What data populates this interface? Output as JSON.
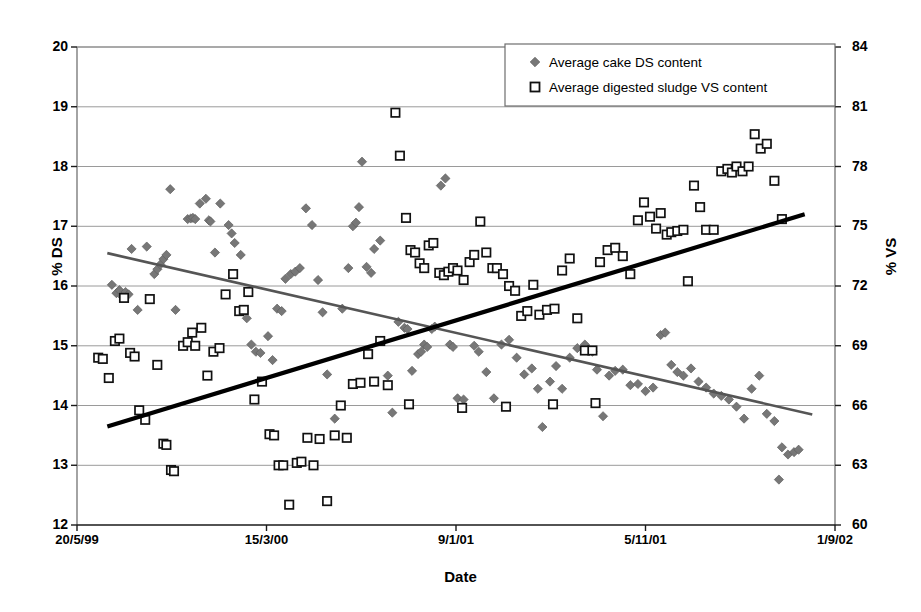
{
  "chart_data": {
    "type": "scatter",
    "title": "",
    "xlabel": "Date",
    "ylabel": "% DS",
    "y2label": "% VS",
    "xlim": [
      0,
      100
    ],
    "ylim": [
      12,
      20
    ],
    "y2lim": [
      60,
      84
    ],
    "grid": true,
    "legend_position": "top-right",
    "x_tick_labels": [
      "20/5/99",
      "15/3/00",
      "9/1/01",
      "5/11/01",
      "1/9/02"
    ],
    "x_tick_positions": [
      0,
      25,
      50,
      75,
      100
    ],
    "y_tick_labels": [
      "12",
      "13",
      "14",
      "15",
      "16",
      "17",
      "18",
      "19",
      "20"
    ],
    "y2_tick_labels": [
      "60",
      "63",
      "66",
      "69",
      "72",
      "75",
      "78",
      "81",
      "84"
    ],
    "series": [
      {
        "name": "Average cake DS content",
        "marker": "filled-diamond",
        "color": "#777777",
        "axis": "left",
        "points": [
          [
            4.6,
            16.02
          ],
          [
            5.2,
            15.88
          ],
          [
            5.6,
            15.93
          ],
          [
            6.0,
            15.82
          ],
          [
            6.4,
            15.9
          ],
          [
            6.8,
            15.86
          ],
          [
            7.2,
            16.62
          ],
          [
            8.0,
            15.6
          ],
          [
            9.2,
            16.66
          ],
          [
            10.2,
            16.2
          ],
          [
            10.6,
            16.28
          ],
          [
            11.0,
            16.36
          ],
          [
            11.4,
            16.45
          ],
          [
            11.8,
            16.52
          ],
          [
            12.3,
            17.62
          ],
          [
            13.0,
            15.6
          ],
          [
            14.6,
            17.12
          ],
          [
            15.0,
            17.13
          ],
          [
            15.3,
            17.14
          ],
          [
            15.6,
            17.12
          ],
          [
            16.2,
            17.38
          ],
          [
            17.0,
            17.46
          ],
          [
            17.4,
            17.1
          ],
          [
            17.6,
            17.08
          ],
          [
            18.2,
            16.56
          ],
          [
            18.9,
            17.38
          ],
          [
            20.0,
            17.02
          ],
          [
            20.4,
            16.88
          ],
          [
            20.8,
            16.72
          ],
          [
            21.6,
            16.52
          ],
          [
            22.4,
            15.46
          ],
          [
            23.0,
            15.02
          ],
          [
            23.6,
            14.9
          ],
          [
            24.2,
            14.88
          ],
          [
            25.2,
            15.16
          ],
          [
            25.8,
            14.76
          ],
          [
            26.4,
            15.62
          ],
          [
            27.0,
            15.58
          ],
          [
            27.5,
            16.12
          ],
          [
            28.2,
            16.2
          ],
          [
            28.8,
            16.24
          ],
          [
            29.4,
            16.3
          ],
          [
            30.2,
            17.3
          ],
          [
            31.0,
            17.02
          ],
          [
            31.8,
            16.1
          ],
          [
            32.4,
            15.56
          ],
          [
            33.0,
            14.52
          ],
          [
            34.0,
            13.78
          ],
          [
            35.0,
            15.62
          ],
          [
            35.8,
            16.3
          ],
          [
            36.4,
            17.0
          ],
          [
            36.8,
            17.06
          ],
          [
            37.2,
            17.32
          ],
          [
            37.6,
            18.08
          ],
          [
            38.2,
            16.32
          ],
          [
            38.8,
            16.22
          ],
          [
            39.2,
            16.62
          ],
          [
            40.0,
            16.76
          ],
          [
            41.0,
            14.5
          ],
          [
            41.6,
            13.88
          ],
          [
            42.4,
            15.4
          ],
          [
            43.2,
            15.3
          ],
          [
            43.6,
            15.28
          ],
          [
            44.2,
            14.58
          ],
          [
            45.0,
            14.86
          ],
          [
            45.4,
            14.9
          ],
          [
            45.8,
            15.02
          ],
          [
            46.2,
            14.98
          ],
          [
            46.8,
            15.28
          ],
          [
            47.2,
            15.32
          ],
          [
            48.0,
            17.68
          ],
          [
            48.6,
            17.8
          ],
          [
            49.2,
            15.02
          ],
          [
            49.6,
            14.98
          ],
          [
            50.2,
            14.12
          ],
          [
            51.0,
            14.1
          ],
          [
            52.4,
            15.0
          ],
          [
            53.0,
            14.9
          ],
          [
            54.0,
            14.56
          ],
          [
            55.0,
            14.12
          ],
          [
            56.0,
            15.02
          ],
          [
            57.0,
            15.1
          ],
          [
            58.0,
            14.8
          ],
          [
            59.0,
            14.52
          ],
          [
            60.0,
            14.62
          ],
          [
            60.8,
            14.28
          ],
          [
            61.4,
            13.64
          ],
          [
            62.4,
            14.4
          ],
          [
            63.2,
            14.66
          ],
          [
            64.0,
            14.28
          ],
          [
            65.0,
            14.8
          ],
          [
            66.0,
            14.96
          ],
          [
            67.0,
            15.02
          ],
          [
            68.0,
            14.9
          ],
          [
            68.6,
            14.6
          ],
          [
            69.4,
            13.82
          ],
          [
            70.2,
            14.5
          ],
          [
            71.0,
            14.58
          ],
          [
            72.0,
            14.6
          ],
          [
            73.0,
            14.34
          ],
          [
            74.0,
            14.36
          ],
          [
            75.0,
            14.24
          ],
          [
            76.0,
            14.3
          ],
          [
            77.0,
            15.18
          ],
          [
            77.6,
            15.22
          ],
          [
            78.4,
            14.68
          ],
          [
            79.2,
            14.56
          ],
          [
            80.0,
            14.5
          ],
          [
            81.0,
            14.62
          ],
          [
            82.0,
            14.4
          ],
          [
            83.0,
            14.3
          ],
          [
            84.0,
            14.2
          ],
          [
            85.0,
            14.16
          ],
          [
            86.0,
            14.1
          ],
          [
            87.0,
            13.98
          ],
          [
            88.0,
            13.78
          ],
          [
            89.0,
            14.28
          ],
          [
            90.0,
            14.5
          ],
          [
            91.0,
            13.86
          ],
          [
            92.0,
            13.74
          ],
          [
            93.0,
            13.3
          ],
          [
            93.8,
            13.18
          ],
          [
            94.6,
            13.22
          ],
          [
            95.2,
            13.26
          ],
          [
            92.6,
            12.76
          ]
        ]
      },
      {
        "name": "Average digested sludge VS content",
        "marker": "open-square",
        "color": "#ffffff",
        "edge_color": "#000000",
        "axis": "right",
        "points_ds_equiv": [
          [
            2.8,
            14.8
          ],
          [
            3.4,
            14.78
          ],
          [
            4.2,
            14.46
          ],
          [
            5.0,
            15.08
          ],
          [
            5.6,
            15.12
          ],
          [
            6.2,
            15.8
          ],
          [
            7.0,
            14.88
          ],
          [
            7.6,
            14.82
          ],
          [
            8.2,
            13.92
          ],
          [
            9.0,
            13.76
          ],
          [
            9.6,
            15.78
          ],
          [
            10.6,
            14.68
          ],
          [
            11.4,
            13.36
          ],
          [
            11.8,
            13.34
          ],
          [
            12.4,
            12.92
          ],
          [
            12.8,
            12.9
          ],
          [
            14.0,
            15.0
          ],
          [
            14.6,
            15.06
          ],
          [
            15.2,
            15.22
          ],
          [
            15.6,
            15.0
          ],
          [
            16.4,
            15.3
          ],
          [
            17.2,
            14.5
          ],
          [
            18.0,
            14.9
          ],
          [
            18.8,
            14.96
          ],
          [
            19.6,
            15.86
          ],
          [
            20.6,
            16.2
          ],
          [
            21.4,
            15.58
          ],
          [
            22.0,
            15.6
          ],
          [
            22.6,
            15.9
          ],
          [
            23.4,
            14.1
          ],
          [
            24.4,
            14.4
          ],
          [
            25.4,
            13.52
          ],
          [
            26.0,
            13.5
          ],
          [
            26.6,
            13.0
          ],
          [
            27.2,
            13.0
          ],
          [
            28.0,
            12.34
          ],
          [
            29.0,
            13.04
          ],
          [
            29.6,
            13.06
          ],
          [
            30.4,
            13.46
          ],
          [
            31.2,
            13.0
          ],
          [
            32.0,
            13.44
          ],
          [
            33.0,
            12.4
          ],
          [
            34.0,
            13.5
          ],
          [
            34.8,
            14.0
          ],
          [
            35.6,
            13.46
          ],
          [
            36.4,
            14.36
          ],
          [
            37.4,
            14.38
          ],
          [
            38.4,
            14.86
          ],
          [
            39.2,
            14.4
          ],
          [
            40.0,
            15.08
          ],
          [
            41.0,
            14.34
          ],
          [
            42.0,
            18.9
          ],
          [
            42.6,
            18.18
          ],
          [
            43.4,
            17.14
          ],
          [
            44.0,
            16.6
          ],
          [
            44.6,
            16.56
          ],
          [
            45.2,
            16.38
          ],
          [
            45.8,
            16.3
          ],
          [
            46.4,
            16.68
          ],
          [
            47.0,
            16.72
          ],
          [
            47.8,
            16.22
          ],
          [
            48.4,
            16.18
          ],
          [
            49.0,
            16.24
          ],
          [
            49.6,
            16.3
          ],
          [
            50.2,
            16.26
          ],
          [
            51.0,
            16.1
          ],
          [
            51.8,
            16.4
          ],
          [
            52.4,
            16.52
          ],
          [
            53.2,
            17.08
          ],
          [
            54.0,
            16.56
          ],
          [
            54.8,
            16.3
          ],
          [
            55.4,
            16.3
          ],
          [
            56.2,
            16.2
          ],
          [
            57.0,
            16.0
          ],
          [
            57.8,
            15.92
          ],
          [
            58.6,
            15.5
          ],
          [
            59.4,
            15.58
          ],
          [
            60.2,
            16.02
          ],
          [
            61.0,
            15.52
          ],
          [
            62.0,
            15.6
          ],
          [
            63.0,
            15.62
          ],
          [
            64.0,
            16.26
          ],
          [
            65.0,
            16.46
          ],
          [
            66.0,
            15.46
          ],
          [
            67.0,
            14.92
          ],
          [
            68.0,
            14.92
          ],
          [
            69.0,
            16.4
          ],
          [
            70.0,
            16.6
          ],
          [
            71.0,
            16.64
          ],
          [
            72.0,
            16.5
          ],
          [
            73.0,
            16.2
          ],
          [
            74.0,
            17.1
          ],
          [
            74.8,
            17.4
          ],
          [
            75.6,
            17.16
          ],
          [
            76.4,
            16.96
          ],
          [
            77.0,
            17.22
          ],
          [
            77.8,
            16.86
          ],
          [
            78.4,
            16.9
          ],
          [
            79.2,
            16.92
          ],
          [
            80.0,
            16.94
          ],
          [
            80.6,
            16.08
          ],
          [
            81.4,
            17.68
          ],
          [
            82.2,
            17.32
          ],
          [
            83.0,
            16.94
          ],
          [
            84.0,
            16.94
          ],
          [
            85.0,
            17.92
          ],
          [
            85.8,
            17.96
          ],
          [
            86.4,
            17.9
          ],
          [
            87.0,
            18.0
          ],
          [
            87.8,
            17.92
          ],
          [
            88.6,
            18.0
          ],
          [
            89.4,
            18.54
          ],
          [
            90.2,
            18.3
          ],
          [
            91.0,
            18.38
          ],
          [
            92.0,
            17.76
          ],
          [
            93.0,
            17.12
          ],
          [
            43.8,
            14.02
          ],
          [
            50.8,
            13.96
          ],
          [
            56.6,
            13.98
          ],
          [
            62.8,
            14.02
          ],
          [
            68.4,
            14.04
          ]
        ]
      }
    ],
    "trendlines": [
      {
        "name": "cake DS trendline",
        "style": "thin-gray",
        "color": "#555555",
        "axis": "left",
        "x0": 4.0,
        "y0": 16.55,
        "x1": 97.0,
        "y1": 13.85
      },
      {
        "name": "digested sludge VS trendline",
        "style": "thick-black",
        "color": "#000000",
        "axis": "left-equivalent",
        "x0": 4.0,
        "y0": 13.65,
        "x1": 96.0,
        "y1": 17.2
      }
    ]
  },
  "legend": {
    "items": [
      {
        "label": "Average cake DS content",
        "marker": "filled-diamond"
      },
      {
        "label": "Average digested sludge VS content",
        "marker": "open-square"
      }
    ]
  },
  "axes": {
    "left_title": "% DS",
    "right_title": "% VS",
    "x_title": "Date"
  }
}
